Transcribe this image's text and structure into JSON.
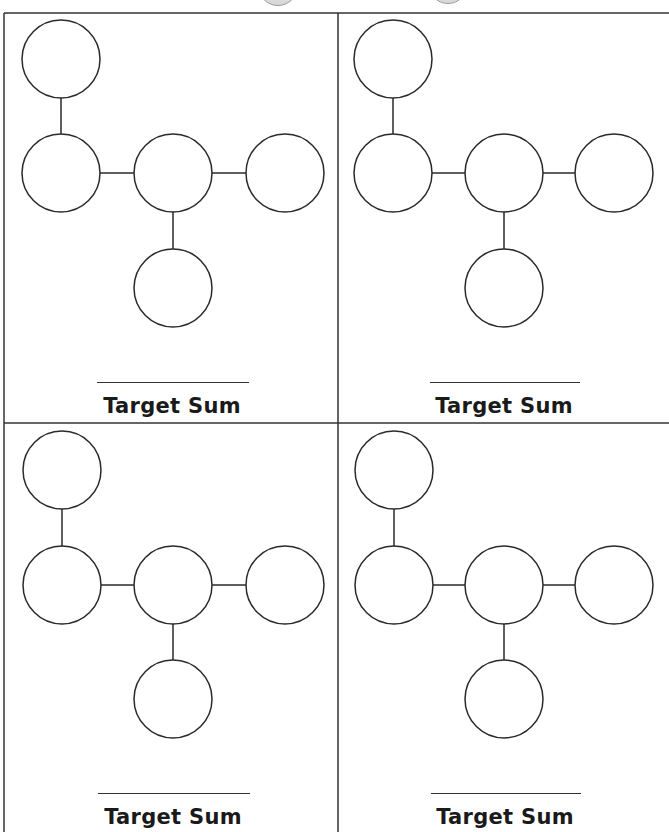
{
  "worksheet": {
    "type": "Target Sum number-placement puzzles",
    "panel_count": 4,
    "circles_per_panel": 5,
    "layout": "T-shape: one circle above left, row of three, one circle below center",
    "panels": [
      {
        "id": "top-left",
        "label": "Target Sum",
        "target_value": "",
        "circles": [
          "",
          "",
          "",
          "",
          ""
        ]
      },
      {
        "id": "top-right",
        "label": "Target Sum",
        "target_value": "",
        "circles": [
          "",
          "",
          "",
          "",
          ""
        ]
      },
      {
        "id": "bottom-left",
        "label": "Target Sum",
        "target_value": "",
        "circles": [
          "",
          "",
          "",
          "",
          ""
        ]
      },
      {
        "id": "bottom-right",
        "label": "Target Sum",
        "target_value": "",
        "circles": [
          "",
          "",
          "",
          "",
          ""
        ]
      }
    ]
  },
  "colors": {
    "line": "#2a2a2a",
    "background": "#ffffff",
    "decorative_gray": "#d9d9d9"
  }
}
